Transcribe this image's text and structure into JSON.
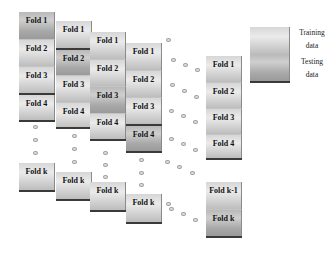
{
  "diagram": {
    "type": "k-fold cross-validation",
    "columns": [
      {
        "folds": [
          "Fold 1",
          "Fold 2",
          "Fold 3",
          "Fold 4"
        ],
        "last": "Fold k",
        "testing_index": 0
      },
      {
        "folds": [
          "Fold 1",
          "Fold 2",
          "Fold 3",
          "Fold 4"
        ],
        "last": "Fold k",
        "testing_index": 1
      },
      {
        "folds": [
          "Fold 1",
          "Fold 2",
          "Fold 3",
          "Fold 4"
        ],
        "last": "Fold k",
        "testing_index": 2
      },
      {
        "folds": [
          "Fold 1",
          "Fold 2",
          "Fold 3",
          "Fold 4"
        ],
        "last": "Fold k",
        "testing_index": 3
      }
    ],
    "final_column": {
      "folds": [
        "Fold 1",
        "Fold 2",
        "Fold 3",
        "Fold 4"
      ],
      "last": [
        "Fold k-1",
        "Fold k"
      ],
      "testing": "Fold k"
    },
    "legend": {
      "training": "Training data",
      "training_line1": "Training",
      "training_line2": "data",
      "testing": "Testing data",
      "testing_line1": "Testing",
      "testing_line2": "data"
    },
    "colors": {
      "training": "#e0e0e0",
      "testing": "#a8a8a8",
      "border": "#3a3a3a",
      "dot": "#9a9a9a"
    }
  }
}
